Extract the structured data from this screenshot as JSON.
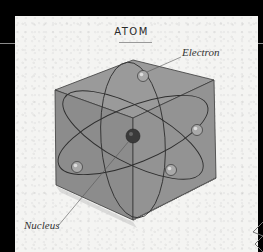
{
  "title": "ATOM",
  "labels": {
    "electron": "Electron",
    "nucleus": "Nucleus"
  },
  "colors": {
    "background": "#000000",
    "paper": "#f4f4f2",
    "cube_face": "#8e8e8e",
    "orbit_line": "#3a3a3a",
    "nucleus": "#3c3c3c",
    "electron": "#a8a8a8"
  },
  "components": {
    "nucleus_count": 1,
    "electron_count": 4,
    "orbit_count": 3
  }
}
